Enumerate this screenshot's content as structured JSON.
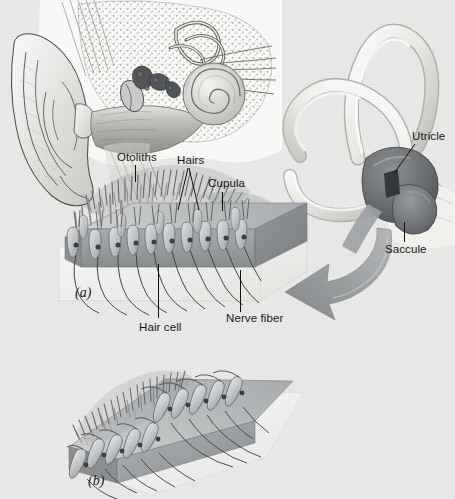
{
  "figure": {
    "background_color": "#e9e9e7",
    "ink_color": "#16161a",
    "width": 455,
    "height": 499
  },
  "labels": {
    "otoliths": "Otoliths",
    "hairs": "Hairs",
    "cupula": "Cupula",
    "utricle": "Utricle",
    "saccule": "Saccule",
    "hair_cell": "Hair cell",
    "nerve_fiber": "Nerve fiber"
  },
  "panels": {
    "a": "(a)",
    "b": "(b)"
  },
  "illustrations": {
    "outer_ear": "outer-ear-cutaway-illustration",
    "cochlea": "cochlea-spiral-illustration",
    "semicircular_canals": "semicircular-canals-illustration",
    "vestibule": "utricle-saccule-vestibule-illustration",
    "macula_block_a": "hair-cell-macula-block-panel-a",
    "macula_block_b": "hair-cell-macula-block-panel-b",
    "pointer_arrow": "curved-pointer-arrow"
  },
  "palette": {
    "paper": "#e9e9e7",
    "slab_top": "#b9bcbd",
    "slab_front": "#9a9d9f",
    "slab_side": "#84888b",
    "otolith_mass": "#6d7173",
    "canal_light": "#f4f3f0",
    "canal_shade": "#c8c8c4",
    "vestibule_dark": "#6b6e70",
    "arrow_gray": "#9fa2a4",
    "cell_body": "#c7cacb",
    "nucleus": "#3c3f41"
  }
}
